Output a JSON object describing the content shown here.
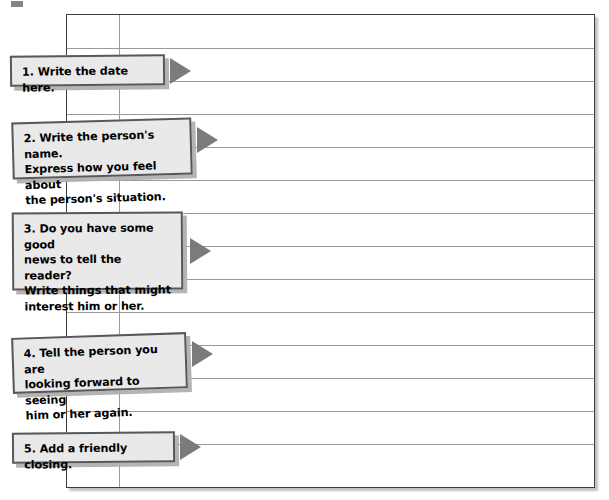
{
  "document": {
    "type": "lined-notebook-worksheet",
    "title": "Friendly Letter Writing Guide",
    "paper": {
      "background_color": "#ffffff",
      "border_color": "#3c3c3c",
      "rule_color": "#9a9a9a",
      "rule_spacing_px": 33,
      "rule_count": 13,
      "margin_line_x_px": 52,
      "left_px": 66,
      "top_px": 14,
      "width_px": 529,
      "height_px": 474
    },
    "callout_style": {
      "fill_color": "#e9e9e9",
      "border_color": "#58585a",
      "shadow_color": "#b0b0b0",
      "arrow_color": "#7b7b7b"
    }
  },
  "steps": [
    {
      "number": "1",
      "label": "step-1-write-the-date",
      "text": "1. Write the date here.",
      "lines": 1,
      "left_px": 10,
      "top_px": 55,
      "width_px": 155,
      "height_px": 31,
      "rotation_deg": -0.6,
      "arrow_left_px": 170,
      "arrow_top_px": 58
    },
    {
      "number": "2",
      "label": "step-2-name-and-feelings",
      "text": "2. Write the person's name.\nExpress how you feel about\nthe person's situation.",
      "lines": 3,
      "left_px": 12,
      "top_px": 120,
      "width_px": 180,
      "height_px": 57,
      "rotation_deg": -1.6,
      "arrow_left_px": 197,
      "arrow_top_px": 127
    },
    {
      "number": "3",
      "label": "step-3-share-good-news",
      "text": "3. Do you have some good\nnews to tell the reader?\nWrite things that might\ninterest him or her.",
      "lines": 4,
      "left_px": 12,
      "top_px": 212,
      "width_px": 171,
      "height_px": 78,
      "rotation_deg": -0.4,
      "arrow_left_px": 190,
      "arrow_top_px": 238
    },
    {
      "number": "4",
      "label": "step-4-looking-forward",
      "text": "4. Tell the person you are\nlooking forward to seeing\nhim or her again.",
      "lines": 3,
      "left_px": 12,
      "top_px": 335,
      "width_px": 175,
      "height_px": 56,
      "rotation_deg": -1.9,
      "arrow_left_px": 192,
      "arrow_top_px": 341
    },
    {
      "number": "5",
      "label": "step-5-friendly-closing",
      "text": "5. Add a friendly closing.",
      "lines": 1,
      "left_px": 12,
      "top_px": 432,
      "width_px": 163,
      "height_px": 31,
      "rotation_deg": -0.5,
      "arrow_left_px": 180,
      "arrow_top_px": 434
    }
  ]
}
